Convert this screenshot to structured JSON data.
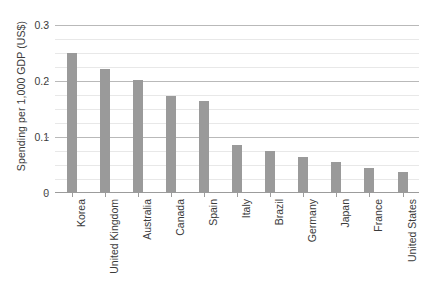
{
  "chart_data": {
    "type": "bar",
    "title": "",
    "subtitle": "",
    "xlabel": "",
    "ylabel": "Spending per 1,000 GDP (US$)",
    "categories": [
      "Korea",
      "United Kingdom",
      "Australia",
      "Canada",
      "Spain",
      "Italy",
      "Brazil",
      "Germany",
      "Japan",
      "France",
      "United States"
    ],
    "values": [
      0.25,
      0.222,
      0.202,
      0.173,
      0.165,
      0.085,
      0.075,
      0.065,
      0.055,
      0.045,
      0.037
    ],
    "ylim": [
      0,
      0.3
    ],
    "y_major_ticks": [
      "0",
      "0.1",
      "0.2",
      "0.3"
    ],
    "y_major_tick_values": [
      0,
      0.1,
      0.2,
      0.3
    ],
    "y_minor_tick_step": 0.025,
    "grid": true,
    "grid_axis": "y",
    "legend": "none",
    "bar_color": "#9a9a9a",
    "gridline_color": "#e8e8e8",
    "major_gridline_color": "#b9b9b9",
    "axis_color": "#9c9c9c",
    "text_color": "#3b3b3b",
    "background": "#ffffff"
  }
}
